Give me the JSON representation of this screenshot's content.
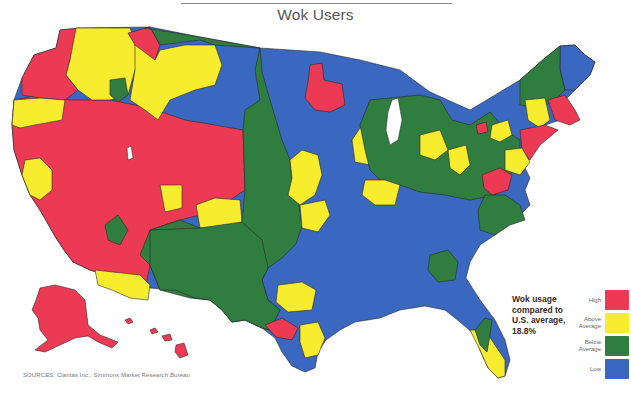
{
  "title": "Wok Users",
  "annotation": {
    "line1": "Wok usage",
    "line2": "compared to",
    "line3": "U.S. average,",
    "line4": "18.8%"
  },
  "legend": {
    "items": [
      {
        "key": "high",
        "label_lines": [
          "High"
        ],
        "color": "#ec3a55"
      },
      {
        "key": "above",
        "label_lines": [
          "Above",
          "Average"
        ],
        "color": "#f7ec2e"
      },
      {
        "key": "below",
        "label_lines": [
          "Below",
          "Average"
        ],
        "color": "#2f7d3f"
      },
      {
        "key": "low",
        "label_lines": [
          "Low"
        ],
        "color": "#3a67bf"
      }
    ]
  },
  "sources": {
    "prefix": "SOURCES:",
    "text": "Claritas Inc.; Simmons Market Research",
    "italic": "Bureau"
  },
  "chart_data": {
    "type": "choropleth",
    "title": "Wok Users",
    "subject": "Wok usage compared to U.S. average, 18.8%",
    "us_average_percent": 18.8,
    "categories": [
      "High",
      "Above Average",
      "Below Average",
      "Low"
    ],
    "category_colors": {
      "High": "#ec3a55",
      "Above Average": "#f7ec2e",
      "Below Average": "#2f7d3f",
      "Low": "#3a67bf"
    },
    "legend_position": "bottom-right",
    "regions": [
      {
        "area": "Pacific Northwest coast (WA/OR west)",
        "category": "High"
      },
      {
        "area": "Eastern Washington / Idaho panhandle",
        "category": "Above Average"
      },
      {
        "area": "Western Montana",
        "category": "High"
      },
      {
        "area": "Central/Eastern Montana & Wyoming north",
        "category": "Above Average"
      },
      {
        "area": "Oregon interior",
        "category": "Above Average"
      },
      {
        "area": "California coast & Nevada",
        "category": "High"
      },
      {
        "area": "California Central Valley",
        "category": "Above Average"
      },
      {
        "area": "Utah",
        "category": "High"
      },
      {
        "area": "Colorado",
        "category": "High"
      },
      {
        "area": "Arizona / Southern California",
        "category": "High"
      },
      {
        "area": "Southern Arizona border",
        "category": "Above Average"
      },
      {
        "area": "New Mexico west",
        "category": "Below Average"
      },
      {
        "area": "Dakotas & Great Plains",
        "category": "Below Average"
      },
      {
        "area": "West Texas",
        "category": "Below Average"
      },
      {
        "area": "Minnesota outer",
        "category": "Low"
      },
      {
        "area": "Minneapolis area",
        "category": "High"
      },
      {
        "area": "Iowa / Missouri north",
        "category": "Above Average"
      },
      {
        "area": "Chicago area",
        "category": "High"
      },
      {
        "area": "Michigan / Ohio / Indiana",
        "category": "Below Average"
      },
      {
        "area": "Southeast & South Central US",
        "category": "Low"
      },
      {
        "area": "Atlanta area",
        "category": "Below Average"
      },
      {
        "area": "Dallas area",
        "category": "Above Average"
      },
      {
        "area": "Austin area",
        "category": "High"
      },
      {
        "area": "Houston area",
        "category": "Above Average"
      },
      {
        "area": "South Texas",
        "category": "Low"
      },
      {
        "area": "Florida coasts",
        "category": "Above Average"
      },
      {
        "area": "Florida interior / Tampa",
        "category": "Below Average"
      },
      {
        "area": "Maine",
        "category": "Low"
      },
      {
        "area": "Vermont / New Hampshire",
        "category": "Below Average"
      },
      {
        "area": "Boston area",
        "category": "High"
      },
      {
        "area": "New York City / New Jersey",
        "category": "High"
      },
      {
        "area": "Philadelphia area",
        "category": "Above Average"
      },
      {
        "area": "Washington DC / Baltimore",
        "category": "High"
      },
      {
        "area": "Virginia / Mid-Atlantic",
        "category": "Below Average"
      },
      {
        "area": "Upstate New York",
        "category": "Above Average"
      },
      {
        "area": "Alaska",
        "category": "High"
      },
      {
        "area": "Hawaii",
        "category": "High"
      }
    ]
  }
}
